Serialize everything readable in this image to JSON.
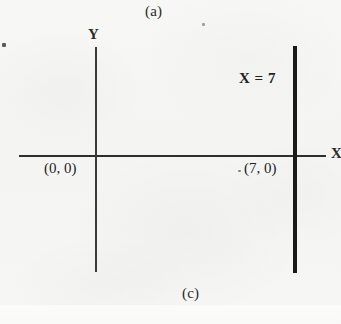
{
  "figure": {
    "top_panel_label": "(a)",
    "bottom_panel_label": "(c)",
    "background_color": "#f6f6f4",
    "ink_color": "#1f1f1f"
  },
  "axes": {
    "y_axis_label": "Y",
    "x_axis_label": "X"
  },
  "annotations": {
    "line_equation": "X = 7",
    "origin_point": "(0, 0)",
    "intercept_point": "(7, 0)"
  },
  "chart_data": {
    "type": "line",
    "title": "(c)",
    "subtitle": "(a)",
    "xlabel": "X",
    "ylabel": "Y",
    "grid": false,
    "legend_position": "none",
    "xlim": [
      -4,
      9
    ],
    "ylim": [
      -5,
      5
    ],
    "annotations": [
      {
        "text": "X = 7",
        "x": 5.4,
        "y": 3.2
      },
      {
        "text": "(0, 0)",
        "x": -1.6,
        "y": -0.55
      },
      {
        "text": "(7, 0)",
        "x": 5.6,
        "y": -0.55
      }
    ],
    "series": [
      {
        "name": "X = 7",
        "type": "vertical-line",
        "equation": "x = 7",
        "x": 7,
        "y_range": [
          -4.8,
          4.7
        ],
        "style": "solid",
        "linewidth": 4,
        "color": "#1a1a1a"
      },
      {
        "name": "Y axis",
        "type": "axis-line",
        "equation": "x = 0",
        "x": 0,
        "y_range": [
          -4.8,
          4.7
        ],
        "style": "solid",
        "linewidth": 2,
        "color": "#3a3a3a"
      },
      {
        "name": "X axis",
        "type": "axis-line",
        "equation": "y = 0",
        "y": 0,
        "x_range": [
          -3.2,
          8.5
        ],
        "style": "solid",
        "linewidth": 2,
        "color": "#2e2e2e"
      }
    ],
    "points": [
      {
        "label": "(0, 0)",
        "x": 0,
        "y": 0
      },
      {
        "label": "(7, 0)",
        "x": 7,
        "y": 0
      }
    ]
  }
}
